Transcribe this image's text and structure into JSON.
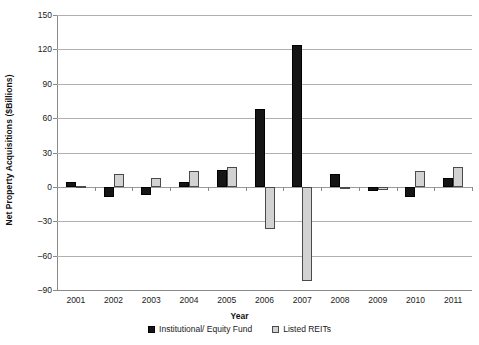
{
  "chart_data": {
    "type": "bar",
    "title": "",
    "xlabel": "Year",
    "ylabel": "Net Property Acquisitions ($Billions)",
    "categories": [
      "2001",
      "2002",
      "2003",
      "2004",
      "2005",
      "2006",
      "2007",
      "2008",
      "2009",
      "2010",
      "2011"
    ],
    "series": [
      {
        "name": "Institutional/ Equity Fund",
        "color": "#151515",
        "values": [
          4,
          -9,
          -7,
          4,
          15,
          68,
          124,
          11,
          -4,
          -9,
          8
        ]
      },
      {
        "name": "Listed REITs",
        "color": "#d2d2d2",
        "values": [
          1,
          11,
          8,
          14,
          17,
          -37,
          -82,
          -2,
          -3,
          14,
          17
        ]
      }
    ],
    "ylim": [
      -90,
      150
    ],
    "yticks": [
      150,
      120,
      90,
      60,
      30,
      0,
      -30,
      -60,
      -90
    ],
    "ytick_labels": [
      "150",
      "120",
      "90",
      "60",
      "30",
      "0",
      "–30",
      "–60",
      "–90"
    ],
    "grid": "horizontal",
    "legend_position": "bottom"
  },
  "legend": {
    "entries": [
      {
        "label": "Institutional/ Equity Fund"
      },
      {
        "label": "Listed REITs"
      }
    ]
  }
}
